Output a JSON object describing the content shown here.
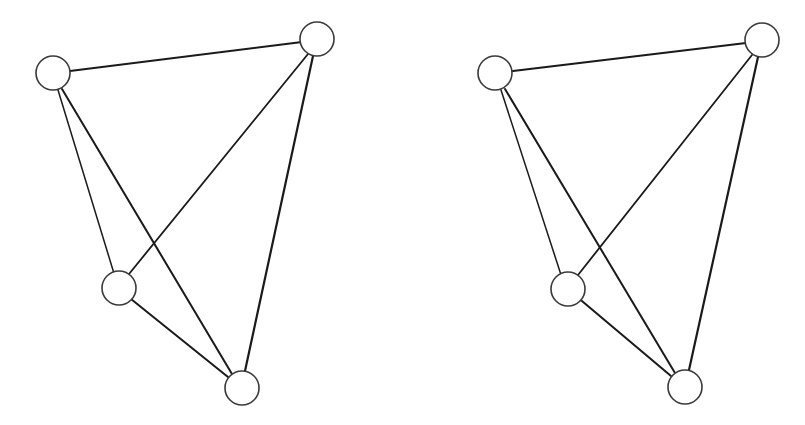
{
  "figure": {
    "background_color": "#ffffff",
    "line_color": "#1a1a1a",
    "node_stroke_color": "#3a3a3a",
    "node_radius": 17,
    "panels": [
      {
        "id": "left",
        "nodes": [
          {
            "id": "A",
            "x": 53,
            "y": 73
          },
          {
            "id": "B",
            "x": 317,
            "y": 39
          },
          {
            "id": "C",
            "x": 119,
            "y": 288
          },
          {
            "id": "D",
            "x": 242,
            "y": 388
          }
        ],
        "edges": [
          {
            "from": "A",
            "to": "B",
            "width": 2.2,
            "x1": 70,
            "y1": 71,
            "x2": 302,
            "y2": 42
          },
          {
            "from": "A",
            "to": "C",
            "width": 1.5,
            "x1": 58,
            "y1": 90,
            "x2": 116,
            "y2": 280
          },
          {
            "from": "A",
            "to": "D",
            "width": 2.0,
            "x1": 62,
            "y1": 89,
            "x2": 232,
            "y2": 374
          },
          {
            "from": "B",
            "to": "C",
            "width": 1.8,
            "x1": 308,
            "y1": 54,
            "x2": 129,
            "y2": 274
          },
          {
            "from": "B",
            "to": "D",
            "width": 2.2,
            "x1": 313,
            "y1": 56,
            "x2": 245,
            "y2": 371
          },
          {
            "from": "C",
            "to": "D",
            "width": 2.0,
            "x1": 126,
            "y1": 295,
            "x2": 228,
            "y2": 377
          }
        ]
      },
      {
        "id": "right",
        "nodes": [
          {
            "id": "A",
            "x": 495,
            "y": 73
          },
          {
            "id": "B",
            "x": 762,
            "y": 40
          },
          {
            "id": "C",
            "x": 568,
            "y": 289
          },
          {
            "id": "D",
            "x": 685,
            "y": 387
          }
        ],
        "edges": [
          {
            "from": "A",
            "to": "B",
            "width": 2.2,
            "x1": 513,
            "y1": 71,
            "x2": 746,
            "y2": 43
          },
          {
            "from": "A",
            "to": "C",
            "width": 1.5,
            "x1": 501,
            "y1": 90,
            "x2": 563,
            "y2": 281
          },
          {
            "from": "A",
            "to": "D",
            "width": 2.0,
            "x1": 505,
            "y1": 89,
            "x2": 675,
            "y2": 373
          },
          {
            "from": "B",
            "to": "C",
            "width": 1.8,
            "x1": 752,
            "y1": 55,
            "x2": 578,
            "y2": 275
          },
          {
            "from": "B",
            "to": "D",
            "width": 2.2,
            "x1": 758,
            "y1": 57,
            "x2": 689,
            "y2": 370
          },
          {
            "from": "C",
            "to": "D",
            "width": 2.0,
            "x1": 576,
            "y1": 296,
            "x2": 671,
            "y2": 376
          }
        ]
      }
    ]
  }
}
